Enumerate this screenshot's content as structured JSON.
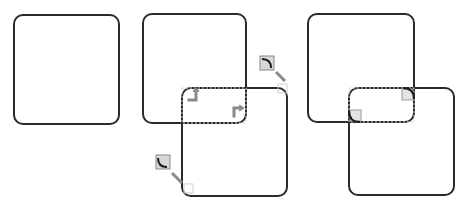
{
  "diagram": {
    "colors": {
      "stroke": "#2a2a2a",
      "marker": "#8a8a8a",
      "marker_fill": "#d8d8d8",
      "guide": "#c8c8c8",
      "background": "#ffffff"
    },
    "stages": [
      {
        "name": "single-square",
        "shapes": [
          {
            "x": 14,
            "y": 15,
            "w": 105,
            "h": 109,
            "r": 9
          }
        ]
      },
      {
        "name": "overlap-with-corner-markers",
        "shapes": [
          {
            "x": 143,
            "y": 14,
            "w": 103,
            "h": 109,
            "r": 9
          },
          {
            "x": 182,
            "y": 88,
            "w": 105,
            "h": 108,
            "r": 9
          }
        ],
        "markers": [
          {
            "type": "inner-corner-arrow",
            "x": 190,
            "y": 90,
            "dir": "up-left"
          },
          {
            "type": "inner-corner-arrow",
            "x": 231,
            "y": 104,
            "dir": "down-right"
          },
          {
            "type": "corner-callout",
            "icon_x": 260,
            "icon_y": 56,
            "pointer_to_x": 285,
            "pointer_to_y": 82,
            "arc": "top-right"
          },
          {
            "type": "corner-callout",
            "icon_x": 156,
            "icon_y": 155,
            "pointer_to_x": 186,
            "pointer_to_y": 188,
            "arc": "bottom-left"
          }
        ]
      },
      {
        "name": "rounded-intersection",
        "shapes": [
          {
            "x": 308,
            "y": 14,
            "w": 106,
            "h": 108,
            "r": 9
          },
          {
            "x": 349,
            "y": 88,
            "w": 105,
            "h": 107,
            "r": 9
          }
        ],
        "intersection": {
          "x": 349,
          "y": 88,
          "w": 65,
          "h": 34,
          "r": 9
        }
      }
    ]
  }
}
